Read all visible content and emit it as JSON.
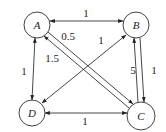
{
  "graph": {
    "nodes": [
      {
        "id": "A",
        "label": "A",
        "x": 37,
        "y": 25
      },
      {
        "id": "B",
        "label": "B",
        "x": 136,
        "y": 25
      },
      {
        "id": "C",
        "label": "C",
        "x": 141,
        "y": 116
      },
      {
        "id": "D",
        "label": "D",
        "x": 32,
        "y": 113
      }
    ],
    "edges": [
      {
        "from": "A",
        "to": "B",
        "weight": "1",
        "direction": "both"
      },
      {
        "from": "A",
        "to": "D",
        "weight": "1",
        "direction": "both"
      },
      {
        "from": "D",
        "to": "C",
        "weight": "1",
        "direction": "both"
      },
      {
        "from": "D",
        "to": "B",
        "weight": "1",
        "direction": "both"
      },
      {
        "from": "A",
        "to": "C",
        "weight": "0.5",
        "direction": "forward"
      },
      {
        "from": "C",
        "to": "A",
        "weight": "1.5",
        "direction": "forward"
      },
      {
        "from": "C",
        "to": "B",
        "weight": "5",
        "direction": "forward"
      },
      {
        "from": "B",
        "to": "C",
        "weight": "1",
        "direction": "forward"
      }
    ]
  },
  "labels": {
    "node_a": "A",
    "node_b": "B",
    "node_c": "C",
    "node_d": "D",
    "w_ab": "1",
    "w_ad": "1",
    "w_dc": "1",
    "w_db": "1",
    "w_ac": "0.5",
    "w_ca": "1.5",
    "w_cb": "5",
    "w_bc": "1"
  }
}
